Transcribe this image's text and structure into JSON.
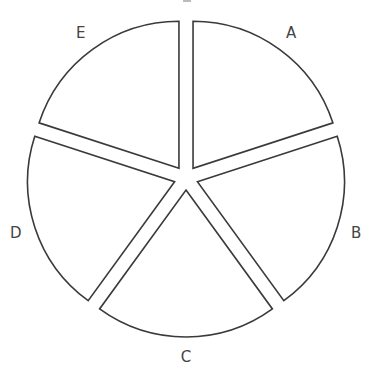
{
  "chart_data": {
    "type": "pie",
    "style": "exploded",
    "title": "",
    "categories": [
      "A",
      "B",
      "C",
      "D",
      "E"
    ],
    "values": [
      20,
      20,
      20,
      20,
      20
    ],
    "start_angle_deg": 0,
    "direction": "clockwise",
    "legend": "none",
    "labels_outside": true,
    "geometry": {
      "cx": 186,
      "cy": 178,
      "r": 147,
      "explode": 12
    },
    "colors": {
      "fill": "#ffffff",
      "stroke": "#3a3a3a",
      "label": "#444444"
    }
  }
}
